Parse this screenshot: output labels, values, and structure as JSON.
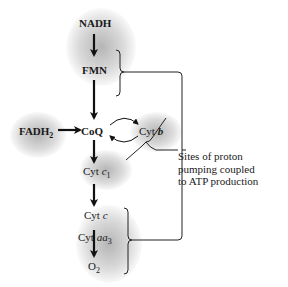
{
  "diagram": {
    "type": "electron-transport-chain",
    "nodes": {
      "nadh": "NADH",
      "fmn": "FMN",
      "fadh2_base": "FADH",
      "fadh2_sub": "2",
      "coq": "CoQ",
      "cytb_prefix": "Cyt ",
      "cytb_italic": "b",
      "cytc1_prefix": "Cyt ",
      "cytc1_italic": "c",
      "cytc1_sub": "1",
      "cytc_prefix": "Cyt ",
      "cytc_italic": "c",
      "cytaa3_prefix": "Cyt ",
      "cytaa3_italic": "aa",
      "cytaa3_sub": "3",
      "o2_base": "O",
      "o2_sub": "2"
    },
    "annotation": {
      "line1": "Sites of proton",
      "line2": "pumping coupled",
      "line3": "to ATP production"
    },
    "edges": [
      {
        "from": "NADH",
        "to": "FMN"
      },
      {
        "from": "FMN",
        "to": "CoQ"
      },
      {
        "from": "FADH2",
        "to": "CoQ"
      },
      {
        "from": "CoQ",
        "to": "Cyt b",
        "type": "cycle"
      },
      {
        "from": "CoQ",
        "to": "Cyt c1"
      },
      {
        "from": "Cyt c1",
        "to": "Cyt c"
      },
      {
        "from": "Cyt c",
        "to": "Cyt aa3"
      },
      {
        "from": "Cyt aa3",
        "to": "O2"
      }
    ],
    "colors": {
      "text": "#1a1a1a",
      "glow": "#8a8a8a",
      "background": "#ffffff"
    }
  }
}
